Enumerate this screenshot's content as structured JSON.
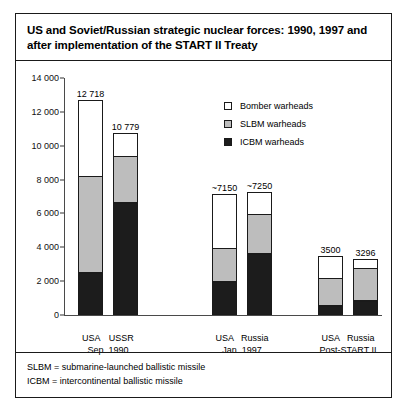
{
  "chart_data": {
    "type": "bar",
    "title": "US and Soviet/Russian strategic nuclear forces: 1990, 1997 and after implementation of the START II Treaty",
    "xlabel": "",
    "ylabel": "",
    "ylim": [
      0,
      14000
    ],
    "ytick_labels": [
      "0",
      "2 000",
      "4 000",
      "6 000",
      "8 000",
      "10 000",
      "12 000",
      "14 000"
    ],
    "ytick_values": [
      0,
      2000,
      4000,
      6000,
      8000,
      10000,
      12000,
      14000
    ],
    "grid": false,
    "legend_position": "upper right",
    "stacked": true,
    "categories": [
      "USA",
      "USSR",
      "USA",
      "Russia",
      "USA",
      "Russia"
    ],
    "groups": [
      {
        "period": "Sep. 1990",
        "countries": [
          "USA",
          "USSR"
        ]
      },
      {
        "period": "Jan. 1997",
        "countries": [
          "USA",
          "Russia"
        ]
      },
      {
        "period": "Post-START II",
        "countries": [
          "USA",
          "Russia"
        ]
      }
    ],
    "series": [
      {
        "name": "ICBM warheads",
        "color": "#1c1c1c",
        "values": [
          2450,
          6600,
          1950,
          3600,
          500,
          800
        ]
      },
      {
        "name": "SLBM warheads",
        "color": "#bdbdbd",
        "values": [
          5750,
          2800,
          2000,
          2400,
          1700,
          2000
        ]
      },
      {
        "name": "Bomber warheads",
        "color": "#ffffff",
        "values": [
          4518,
          1379,
          3200,
          1250,
          1300,
          496
        ]
      }
    ],
    "totals": [
      12718,
      10779,
      7150,
      7250,
      3500,
      3296
    ],
    "data_labels": [
      "12 718",
      "10 779",
      "~7150",
      "~7250",
      "3500",
      "3296"
    ],
    "legend": [
      {
        "label": "Bomber warheads",
        "swatch": "white"
      },
      {
        "label": "SLBM warheads",
        "swatch": "gray"
      },
      {
        "label": "ICBM warheads",
        "swatch": "black"
      }
    ],
    "footnotes": [
      "SLBM = submarine-launched ballistic missile",
      "ICBM = intercontinental ballistic missile"
    ]
  }
}
